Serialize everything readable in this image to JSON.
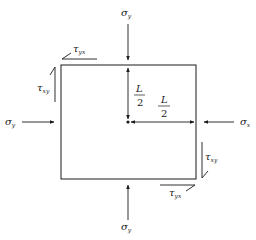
{
  "diagram": {
    "labels": {
      "sigma_y_top": {
        "symbol": "σ",
        "sub": "y"
      },
      "sigma_y_bottom": {
        "symbol": "σ",
        "sub": "y"
      },
      "sigma_y_left": {
        "symbol": "σ",
        "sub": "y"
      },
      "sigma_x_right": {
        "symbol": "σ",
        "sub": "x"
      },
      "tau_yx_top": {
        "symbol": "τ",
        "sub": "yx"
      },
      "tau_xy_left": {
        "symbol": "τ",
        "sub": "xy"
      },
      "tau_xy_right": {
        "symbol": "τ",
        "sub": "xy"
      },
      "tau_yx_bottom": {
        "symbol": "τ",
        "sub": "yx"
      },
      "dim_vertical": {
        "num": "L",
        "den": "2"
      },
      "dim_horizontal": {
        "num": "L",
        "den": "2"
      }
    },
    "colors": {
      "stroke": "#1a1a1a",
      "background": "#ffffff"
    }
  }
}
